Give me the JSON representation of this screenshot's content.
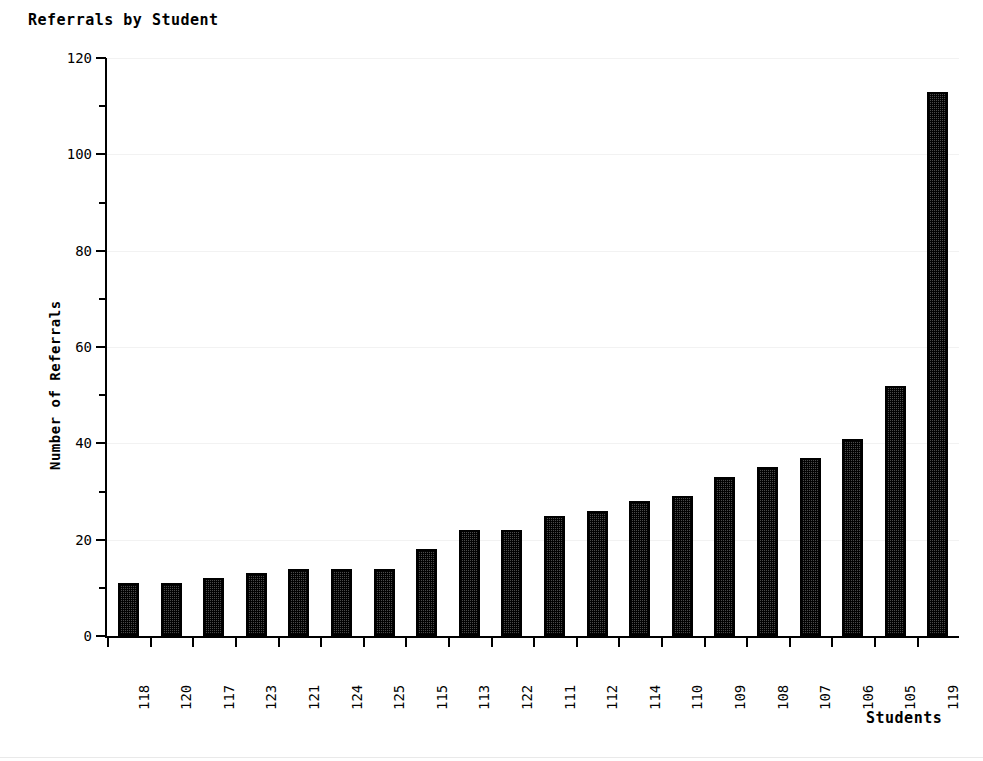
{
  "chart_data": {
    "type": "bar",
    "title": "Referrals by Student",
    "xlabel": "Students",
    "ylabel": "Number of Referrals",
    "categories": [
      "118",
      "120",
      "117",
      "123",
      "121",
      "124",
      "125",
      "115",
      "113",
      "122",
      "111",
      "112",
      "114",
      "110",
      "109",
      "108",
      "107",
      "106",
      "105",
      "119"
    ],
    "values": [
      11,
      11,
      12,
      13,
      14,
      14,
      14,
      18,
      22,
      22,
      25,
      26,
      28,
      29,
      33,
      35,
      37,
      41,
      52,
      113
    ],
    "ylim": [
      0,
      120
    ],
    "y_major_ticks": [
      0,
      20,
      40,
      60,
      80,
      100,
      120
    ],
    "y_minor_ticks": [
      10,
      30,
      50,
      70,
      90,
      110
    ],
    "y_tick_labels": [
      "0",
      "20",
      "40",
      "60",
      "80",
      "100",
      "120"
    ],
    "grid": true,
    "legend": "none",
    "bar_color": "#3b3b3b",
    "bar_border_color": "#000000",
    "background": "#ffffff",
    "gridline_color": "#f2f2f2"
  }
}
